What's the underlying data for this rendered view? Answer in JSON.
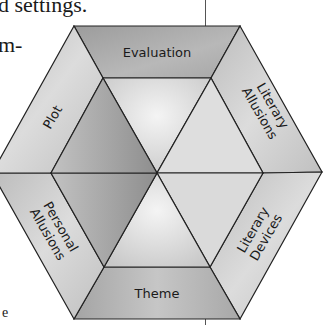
{
  "page_text": {
    "line_1": "d settings.",
    "line_2": "m-",
    "line_3": "e"
  },
  "diagram": {
    "type": "hexagon",
    "segments": [
      {
        "position": "top",
        "label": "Evaluation"
      },
      {
        "position": "upper-right",
        "label_line_1": "Literary",
        "label_line_2": "Allusions"
      },
      {
        "position": "lower-right",
        "label_line_1": "Literary",
        "label_line_2": "Devices"
      },
      {
        "position": "bottom",
        "label": "Theme"
      },
      {
        "position": "lower-left",
        "label_line_1": "Personal",
        "label_line_2": "Allusions"
      },
      {
        "position": "upper-left",
        "label": "Plot"
      }
    ],
    "colors": {
      "outline": "#222222",
      "top_fill": "#a9a9a9",
      "side_fill": "#c4c4c4",
      "bottom_fill": "#b0b0b0",
      "inner_light": "#e8e8e8",
      "inner_dark": "#9a9a9a"
    }
  }
}
